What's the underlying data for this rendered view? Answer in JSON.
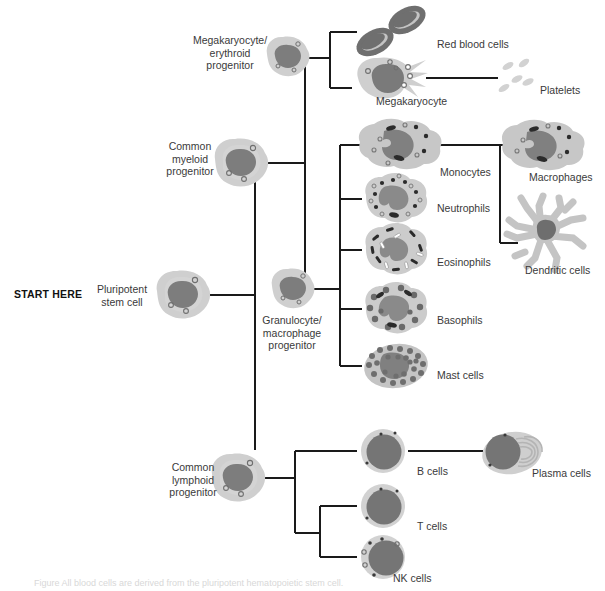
{
  "figure": {
    "start_marker": "START HERE",
    "caption_partial": "Figure  All blood cells are derived from the pluripotent hematopoietic stem cell."
  },
  "colors": {
    "cytoplasm": "#c9c9c9",
    "cytoplasm_light": "#d6d6d6",
    "nucleus": "#7b7b7b",
    "nucleus_dark": "#6e6e6e",
    "granule_dark": "#2b2b2b",
    "granule_light": "#f2f2f2",
    "rbc": "#7a7a7a",
    "platelet": "#cfcfcf",
    "line": "#1a1a1a",
    "text": "#3a3a3a",
    "text_bold": "#111111",
    "background": "#ffffff"
  },
  "nodes": {
    "pluripotent_stem_cell": {
      "label": "Pluripotent\nstem cell",
      "label_x": 88,
      "label_y": 283,
      "cell_x": 183,
      "cell_y": 295
    },
    "common_myeloid_progenitor": {
      "label": "Common\nmyeloid\nprogenitor",
      "label_x": 162,
      "label_y": 140,
      "cell_x": 241,
      "cell_y": 163
    },
    "megakaryocyte_erythroid_progenitor": {
      "label": "Megakaryocyte/\nerythroid\nprogenitor",
      "label_x": 192,
      "label_y": 34,
      "cell_x": 288,
      "cell_y": 57
    },
    "granulocyte_macrophage_progenitor": {
      "label": "Granulocyte/\nmacrophage\nprogenitor",
      "label_x": 254,
      "label_y": 313,
      "cell_x": 293,
      "cell_y": 289
    },
    "common_lymphoid_progenitor": {
      "label": "Common\nlymphoid\nprogenitor",
      "label_x": 163,
      "label_y": 460,
      "cell_x": 238,
      "cell_y": 478
    }
  },
  "terminal_cells": [
    {
      "id": "red-blood-cells",
      "label": "Red blood cells",
      "label_x": 436,
      "label_y": 38,
      "cell_x": 392,
      "cell_y": 32
    },
    {
      "id": "megakaryocyte",
      "label": "Megakaryocyte",
      "label_x": 377,
      "label_y": 96,
      "cell_x": 390,
      "cell_y": 78
    },
    {
      "id": "platelets",
      "label": "Platelets",
      "label_x": 541,
      "label_y": 84,
      "cell_x": 510,
      "cell_y": 78
    },
    {
      "id": "monocytes",
      "label": "Monocytes",
      "label_x": 440,
      "label_y": 167,
      "cell_x": 400,
      "cell_y": 145
    },
    {
      "id": "neutrophils",
      "label": "Neutrophils",
      "label_x": 436,
      "label_y": 203,
      "cell_x": 396,
      "cell_y": 199
    },
    {
      "id": "eosinophils",
      "label": "Eosinophils",
      "label_x": 437,
      "label_y": 257,
      "cell_x": 396,
      "cell_y": 250
    },
    {
      "id": "basophils",
      "label": "Basophils",
      "label_x": 437,
      "label_y": 315,
      "cell_x": 396,
      "cell_y": 309
    },
    {
      "id": "mast-cells",
      "label": "Mast cells",
      "label_x": 437,
      "label_y": 370,
      "cell_x": 396,
      "cell_y": 366
    },
    {
      "id": "macrophages",
      "label": "Macrophages",
      "label_x": 530,
      "label_y": 172,
      "cell_x": 543,
      "cell_y": 146
    },
    {
      "id": "dendritic-cells",
      "label": "Dendritic cells",
      "label_x": 526,
      "label_y": 265,
      "cell_x": 545,
      "cell_y": 230
    },
    {
      "id": "b-cells",
      "label": "B cells",
      "label_x": 416,
      "label_y": 466,
      "cell_x": 383,
      "cell_y": 451
    },
    {
      "id": "plasma-cells",
      "label": "Plasma cells",
      "label_x": 533,
      "label_y": 468,
      "cell_x": 510,
      "cell_y": 453
    },
    {
      "id": "t-cells",
      "label": "T cells",
      "label_x": 416,
      "label_y": 521,
      "cell_x": 383,
      "cell_y": 506
    },
    {
      "id": "nk-cells",
      "label": "NK cells",
      "label_x": 392,
      "label_y": 573,
      "cell_x": 383,
      "cell_y": 557
    }
  ],
  "lineages": [
    {
      "from": "pluripotent_stem_cell",
      "to": "common_myeloid_progenitor"
    },
    {
      "from": "pluripotent_stem_cell",
      "to": "common_lymphoid_progenitor"
    },
    {
      "from": "common_myeloid_progenitor",
      "to": "megakaryocyte_erythroid_progenitor"
    },
    {
      "from": "common_myeloid_progenitor",
      "to": "granulocyte_macrophage_progenitor"
    },
    {
      "from": "megakaryocyte_erythroid_progenitor",
      "to": "red-blood-cells"
    },
    {
      "from": "megakaryocyte_erythroid_progenitor",
      "to": "megakaryocyte"
    },
    {
      "from": "megakaryocyte",
      "to": "platelets"
    },
    {
      "from": "granulocyte_macrophage_progenitor",
      "to": "monocytes"
    },
    {
      "from": "granulocyte_macrophage_progenitor",
      "to": "neutrophils"
    },
    {
      "from": "granulocyte_macrophage_progenitor",
      "to": "eosinophils"
    },
    {
      "from": "granulocyte_macrophage_progenitor",
      "to": "basophils"
    },
    {
      "from": "granulocyte_macrophage_progenitor",
      "to": "mast-cells"
    },
    {
      "from": "monocytes",
      "to": "macrophages"
    },
    {
      "from": "monocytes",
      "to": "dendritic-cells"
    },
    {
      "from": "common_lymphoid_progenitor",
      "to": "b-cells"
    },
    {
      "from": "common_lymphoid_progenitor",
      "to": "t-cells"
    },
    {
      "from": "common_lymphoid_progenitor",
      "to": "nk-cells"
    },
    {
      "from": "b-cells",
      "to": "plasma-cells"
    }
  ]
}
